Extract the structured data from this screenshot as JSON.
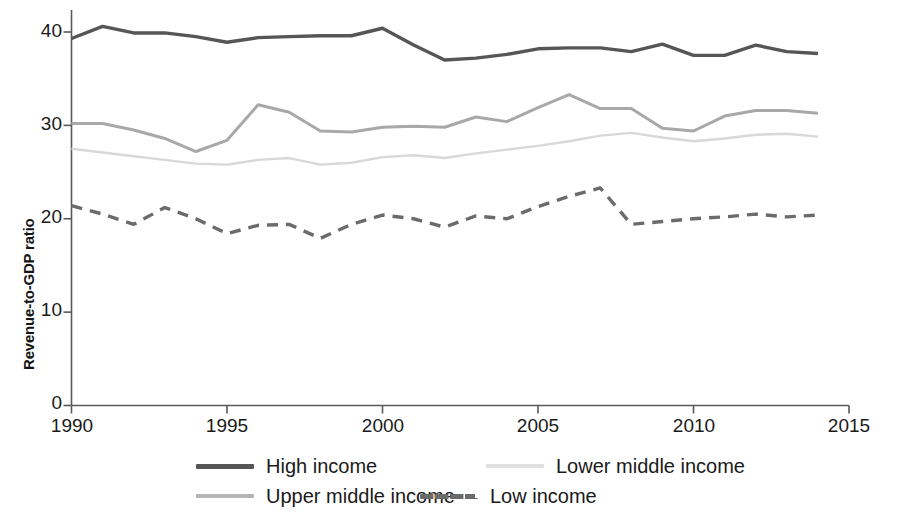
{
  "chart_data": {
    "type": "line",
    "title": "",
    "xlabel": "",
    "ylabel": "Revenue-to-GDP ratio",
    "xlim": [
      1990,
      2015
    ],
    "ylim": [
      0,
      42
    ],
    "grid": false,
    "legend_position": "bottom",
    "x_ticks": [
      "1990",
      "1995",
      "2000",
      "2005",
      "2010",
      "2015"
    ],
    "y_ticks": [
      "0",
      "10",
      "20",
      "30",
      "40"
    ],
    "x": [
      1990,
      1991,
      1992,
      1993,
      1994,
      1995,
      1996,
      1997,
      1998,
      1999,
      2000,
      2001,
      2002,
      2003,
      2004,
      2005,
      2006,
      2007,
      2008,
      2009,
      2010,
      2011,
      2012,
      2013,
      2014
    ],
    "series": [
      {
        "name": "High income",
        "color": "#565656",
        "style": "solid",
        "width": 3.4,
        "values": [
          39.3,
          40.6,
          39.9,
          39.9,
          39.5,
          38.9,
          39.4,
          39.5,
          39.6,
          39.6,
          40.4,
          38.6,
          37.0,
          37.2,
          37.6,
          38.2,
          38.3,
          38.3,
          37.9,
          38.7,
          37.5,
          37.5,
          38.6,
          37.9,
          37.7
        ]
      },
      {
        "name": "Upper middle income",
        "color": "#a8a8a8",
        "style": "solid",
        "width": 3.0,
        "values": [
          30.2,
          30.2,
          29.5,
          28.6,
          27.2,
          28.4,
          32.2,
          31.4,
          29.4,
          29.3,
          29.8,
          29.9,
          29.8,
          30.9,
          30.4,
          31.9,
          33.3,
          31.8,
          31.8,
          29.7,
          29.4,
          31.0,
          31.6,
          31.6,
          31.3
        ]
      },
      {
        "name": "Lower middle income",
        "color": "#d8d8d8",
        "style": "solid",
        "width": 2.4,
        "values": [
          27.5,
          27.1,
          26.7,
          26.3,
          25.9,
          25.8,
          26.3,
          26.5,
          25.8,
          26.0,
          26.6,
          26.8,
          26.5,
          27.0,
          27.4,
          27.8,
          28.3,
          28.9,
          29.2,
          28.7,
          28.3,
          28.6,
          29.0,
          29.1,
          28.8
        ]
      },
      {
        "name": "Low income",
        "color": "#6b6b6b",
        "style": "dashed",
        "width": 3.4,
        "values": [
          21.4,
          20.5,
          19.4,
          21.2,
          20.0,
          18.4,
          19.3,
          19.4,
          17.9,
          19.4,
          20.4,
          20.0,
          19.1,
          20.3,
          20.0,
          21.3,
          22.4,
          23.3,
          19.4,
          19.7,
          20.0,
          20.2,
          20.5,
          20.2,
          20.4
        ]
      }
    ]
  },
  "legend": {
    "entries": [
      {
        "label": "High income"
      },
      {
        "label": "Upper middle income"
      },
      {
        "label": "Lower middle income"
      },
      {
        "label": "Low income"
      }
    ]
  }
}
